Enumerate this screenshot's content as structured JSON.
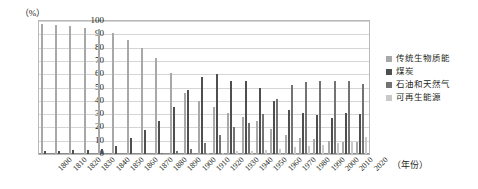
{
  "chart_data": {
    "type": "bar",
    "title": "",
    "subtitle": "",
    "xlabel": "（年份）",
    "ylabel": "（%）",
    "ylim": [
      0,
      100
    ],
    "ytick_step": 10,
    "yticks": [
      100,
      90,
      80,
      70,
      60,
      50,
      40,
      30,
      20,
      10,
      0
    ],
    "grid": true,
    "legend_position": "right",
    "categories": [
      "1800",
      "1810",
      "1820",
      "1830",
      "1840",
      "1850",
      "1860",
      "1870",
      "1880",
      "1890",
      "1900",
      "1910",
      "1920",
      "1930",
      "1940",
      "1950",
      "1960",
      "1970",
      "1980",
      "1990",
      "2000",
      "2010",
      "2020"
    ],
    "series": [
      {
        "name": "传统生物质能",
        "color": "#a8a8a8",
        "values": [
          98,
          97,
          96,
          95,
          94,
          91,
          86,
          80,
          72,
          61,
          46,
          40,
          35,
          31,
          28,
          25,
          19,
          14,
          12,
          11,
          10,
          9,
          9
        ]
      },
      {
        "name": "煤炭",
        "color": "#4f4f4f",
        "values": [
          2,
          2,
          3,
          3,
          4,
          6,
          12,
          18,
          25,
          35,
          48,
          58,
          60,
          55,
          55,
          50,
          40,
          33,
          31,
          29,
          27,
          31,
          30
        ]
      },
      {
        "name": "石油和天然气",
        "color": "#737373",
        "values": [
          0,
          0,
          0,
          0,
          0,
          0,
          0,
          0,
          1,
          2,
          4,
          8,
          14,
          20,
          23,
          30,
          41,
          52,
          54,
          55,
          55,
          55,
          53
        ]
      },
      {
        "name": "可再生能源",
        "color": "#c9c9c9",
        "values": [
          0,
          0,
          0,
          0,
          0,
          0,
          0,
          0,
          0,
          0,
          0,
          1,
          1,
          2,
          2,
          3,
          4,
          5,
          6,
          7,
          8,
          9,
          13
        ]
      }
    ]
  },
  "legend": {
    "items": [
      {
        "label": "传统生物质能",
        "swatch": "s0"
      },
      {
        "label": "煤炭",
        "swatch": "s1"
      },
      {
        "label": "石油和天然气",
        "swatch": "s2"
      },
      {
        "label": "可再生能源",
        "swatch": "s3"
      }
    ]
  }
}
